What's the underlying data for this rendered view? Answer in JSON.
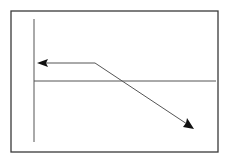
{
  "diagram": {
    "type": "line-diagram",
    "frame": {
      "x": 11,
      "y": 11,
      "width": 207,
      "height": 141,
      "stroke": "#3a3a3a"
    },
    "axes": {
      "vertical": {
        "x": 34,
        "y1": 19,
        "y2": 142,
        "stroke": "#555555"
      },
      "horizontal": {
        "y": 81,
        "x1": 34,
        "x2": 216,
        "stroke": "#555555"
      }
    },
    "polyline": {
      "points": [
        [
          40,
          63
        ],
        [
          95,
          63
        ],
        [
          193,
          128
        ]
      ],
      "stroke": "#555555",
      "start_arrow": "left-arrowhead",
      "end_arrow": "down-right-arrowhead",
      "arrow_color": "#111111"
    }
  }
}
